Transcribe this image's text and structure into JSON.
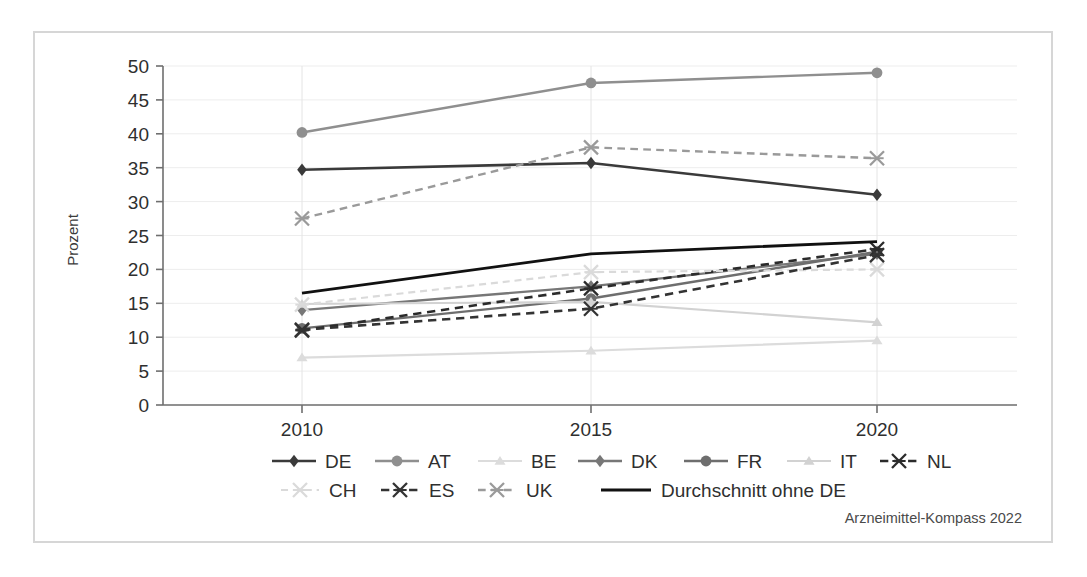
{
  "chart_data": {
    "type": "line",
    "title": "",
    "subtitle": "",
    "xlabel": "",
    "ylabel": "Prozent",
    "x": [
      "2010",
      "2015",
      "2020"
    ],
    "categories": [
      "2010",
      "2015",
      "2020"
    ],
    "ylim": [
      0,
      50
    ],
    "yticks": [
      0,
      5,
      10,
      15,
      20,
      25,
      30,
      35,
      40,
      45,
      50
    ],
    "ytick_labels": [
      "0",
      "5",
      "10",
      "15",
      "20",
      "25",
      "30",
      "35",
      "40",
      "45",
      "50"
    ],
    "grid": true,
    "grid_axis": "both",
    "legend_position": "bottom",
    "source_note": "Arzneimittel-Kompass 2022",
    "series": [
      {
        "name": "DE",
        "values": [
          34.7,
          35.7,
          31.0
        ],
        "color": "#3a3a3a",
        "marker": "diamond",
        "dash": "solid",
        "width": 2.6
      },
      {
        "name": "AT",
        "values": [
          40.2,
          47.5,
          49.0
        ],
        "color": "#8f8f8f",
        "marker": "circle",
        "dash": "solid",
        "width": 2.4
      },
      {
        "name": "BE",
        "values": [
          7.0,
          8.0,
          9.5
        ],
        "color": "#dcdcdc",
        "marker": "triangle",
        "dash": "solid",
        "width": 2.2
      },
      {
        "name": "DK",
        "values": [
          14.0,
          17.5,
          22.3
        ],
        "color": "#777777",
        "marker": "diamond",
        "dash": "solid",
        "width": 2.4
      },
      {
        "name": "FR",
        "values": [
          11.3,
          15.7,
          22.6
        ],
        "color": "#6e6e6e",
        "marker": "circle",
        "dash": "solid",
        "width": 2.4
      },
      {
        "name": "IT",
        "values": [
          14.9,
          15.2,
          12.2
        ],
        "color": "#d2d2d2",
        "marker": "triangle",
        "dash": "solid",
        "width": 2.2
      },
      {
        "name": "NL",
        "values": [
          11.0,
          17.2,
          23.0
        ],
        "color": "#2b2b2b",
        "marker": "asterisk",
        "dash": "dashed",
        "width": 2.6
      },
      {
        "name": "CH",
        "values": [
          14.8,
          19.6,
          20.0
        ],
        "color": "#dadada",
        "marker": "asterisk",
        "dash": "dashed",
        "width": 2.2
      },
      {
        "name": "ES",
        "values": [
          11.1,
          14.2,
          22.1
        ],
        "color": "#333333",
        "marker": "asterisk",
        "dash": "dashed",
        "width": 2.6
      },
      {
        "name": "UK",
        "values": [
          27.5,
          38.0,
          36.4
        ],
        "color": "#9a9a9a",
        "marker": "asterisk",
        "dash": "dashed",
        "width": 2.4
      },
      {
        "name": "Durchschnitt ohne DE",
        "values": [
          16.5,
          22.3,
          24.1
        ],
        "color": "#111111",
        "marker": "none",
        "dash": "solid",
        "width": 2.8
      }
    ]
  },
  "legend": {
    "row1": [
      "DE",
      "AT",
      "BE",
      "DK",
      "FR",
      "IT",
      "NL"
    ],
    "row2": [
      "CH",
      "ES",
      "UK",
      "Durchschnitt ohne DE"
    ]
  },
  "source": {
    "text": "Arzneimittel-Kompass 2022"
  },
  "axes": {
    "y_title": "Prozent",
    "x_labels": [
      "2010",
      "2015",
      "2020"
    ],
    "y_labels": [
      "0",
      "5",
      "10",
      "15",
      "20",
      "25",
      "30",
      "35",
      "40",
      "45",
      "50"
    ]
  }
}
